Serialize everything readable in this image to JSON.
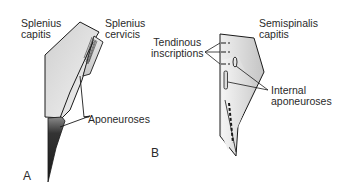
{
  "diagram": {
    "panel_a": {
      "letter": "A",
      "labels": {
        "splenius_capitis": "Splenius\ncapitis",
        "splenius_cervicis": "Splenius\ncervicis",
        "aponeuroses": "Aponeuroses"
      }
    },
    "panel_b": {
      "letter": "B",
      "labels": {
        "semispinalis_capitis": "Semispinalis\ncapitis",
        "tendinous_inscriptions": "Tendinous\ninscriptions",
        "internal_aponeuroses": "Internal\naponeuroses"
      }
    },
    "colors": {
      "muscle_fill": "#d9d9d9",
      "muscle_light": "#ececec",
      "aponeurosis_dark": "#3a3a3a",
      "outline": "#1a1a1a",
      "text": "#2a2a2a"
    }
  }
}
